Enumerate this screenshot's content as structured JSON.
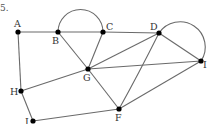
{
  "figure": {
    "number_label": "5.",
    "nodes": [
      {
        "id": "A",
        "label": "A"
      },
      {
        "id": "B",
        "label": "B"
      },
      {
        "id": "C",
        "label": "C"
      },
      {
        "id": "D",
        "label": "D"
      },
      {
        "id": "I_right",
        "label": "I"
      },
      {
        "id": "G",
        "label": "G"
      },
      {
        "id": "H",
        "label": "H"
      },
      {
        "id": "I_bottom",
        "label": "I"
      },
      {
        "id": "F",
        "label": "F"
      }
    ],
    "edges": [
      [
        "A",
        "B"
      ],
      [
        "B",
        "C"
      ],
      [
        "C",
        "D"
      ],
      [
        "A",
        "H"
      ],
      [
        "H",
        "G"
      ],
      [
        "H",
        "I_bottom"
      ],
      [
        "I_bottom",
        "F"
      ],
      [
        "B",
        "G"
      ],
      [
        "C",
        "G"
      ],
      [
        "D",
        "G"
      ],
      [
        "G",
        "I_right"
      ],
      [
        "G",
        "F"
      ],
      [
        "D",
        "F"
      ],
      [
        "D",
        "I_right"
      ],
      [
        "F",
        "I_right"
      ]
    ],
    "curved_edges": [
      [
        "B",
        "C"
      ],
      [
        "D",
        "I_right"
      ]
    ]
  }
}
